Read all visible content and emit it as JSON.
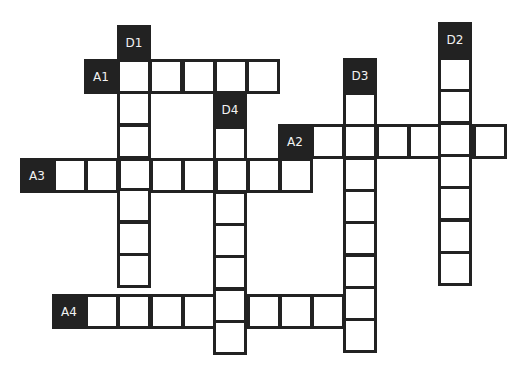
{
  "puzzle": {
    "type": "crossword",
    "clue_labels": [
      {
        "id": "D1",
        "x": 117,
        "y": 25
      },
      {
        "id": "A1",
        "x": 84,
        "y": 59
      },
      {
        "id": "D4",
        "x": 213,
        "y": 92
      },
      {
        "id": "D3",
        "x": 343,
        "y": 58
      },
      {
        "id": "D2",
        "x": 438,
        "y": 22
      },
      {
        "id": "A2",
        "x": 278,
        "y": 124
      },
      {
        "id": "A3",
        "x": 20,
        "y": 158
      },
      {
        "id": "A4",
        "x": 52,
        "y": 294
      }
    ],
    "entries": [
      {
        "id": "A1",
        "direction": "across",
        "start": [
          117,
          59
        ],
        "length": 5
      },
      {
        "id": "A2",
        "direction": "across",
        "start": [
          311,
          124
        ],
        "length": 6
      },
      {
        "id": "A3",
        "direction": "across",
        "start": [
          53,
          158
        ],
        "length": 8
      },
      {
        "id": "A4",
        "direction": "across",
        "start": [
          85,
          294
        ],
        "length": 9
      },
      {
        "id": "D1",
        "direction": "down",
        "start": [
          117,
          59
        ],
        "length": 7
      },
      {
        "id": "D2",
        "direction": "down",
        "start": [
          438,
          57
        ],
        "length": 7
      },
      {
        "id": "D3",
        "direction": "down",
        "start": [
          343,
          92
        ],
        "length": 8
      },
      {
        "id": "D4",
        "direction": "down",
        "start": [
          213,
          126
        ],
        "length": 7
      }
    ],
    "cell_size": 32.3,
    "colors": {
      "label_bg": "#222222",
      "label_text": "#f2f2f2",
      "border": "#222222",
      "cell_bg": "#ffffff"
    }
  }
}
